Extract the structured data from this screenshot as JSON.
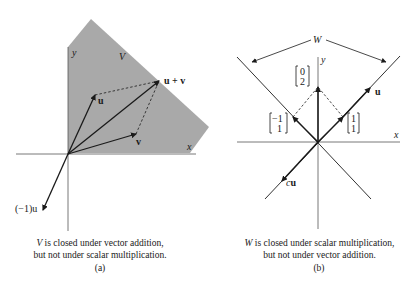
{
  "figure": {
    "panel_a": {
      "region_label": "V",
      "axis_labels": {
        "x": "x",
        "y": "y"
      },
      "vectors": [
        {
          "name": "u",
          "label": "u"
        },
        {
          "name": "v",
          "label": "v"
        },
        {
          "name": "u_plus_v",
          "label": "u + v"
        },
        {
          "name": "neg_u",
          "label": "(−1)u"
        }
      ],
      "caption": {
        "subject": "V",
        "line1_rest": " is closed under vector addition,",
        "line2": "but not under scalar multiplication."
      },
      "tag": "(a)"
    },
    "panel_b": {
      "set_label": "W",
      "axis_labels": {
        "x": "x",
        "y": "y"
      },
      "vectors": [
        {
          "name": "0_2",
          "label": [
            "0",
            "2"
          ]
        },
        {
          "name": "neg1_1",
          "label": [
            "−1",
            "1"
          ]
        },
        {
          "name": "1_1",
          "label": [
            "1",
            "1"
          ]
        },
        {
          "name": "u",
          "label": "u"
        },
        {
          "name": "cu",
          "label_italic": "c",
          "label_bold": "u"
        }
      ],
      "caption": {
        "subject": "W",
        "line1_rest": " is closed under scalar multiplication,",
        "line2": "but not under vector addition."
      },
      "tag": "(b)"
    },
    "colors": {
      "region_fill": "#a9a9a9",
      "ink": "#1a1a1a",
      "axis": "#555555"
    }
  }
}
